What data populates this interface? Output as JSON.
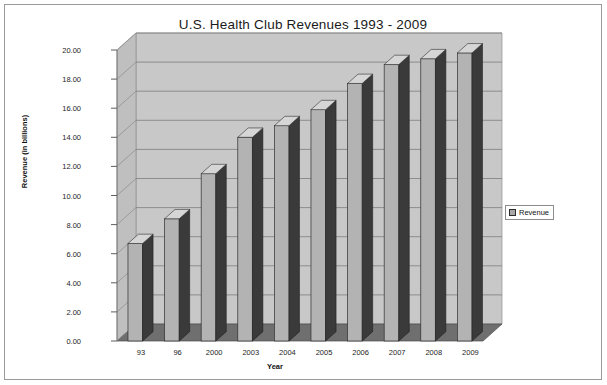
{
  "chart_data": {
    "type": "bar",
    "title": "U.S. Health Club Revenues 1993 - 2009",
    "xlabel": "Year",
    "ylabel": "Revenue (in billions)",
    "categories": [
      "93",
      "96",
      "2000",
      "2003",
      "2004",
      "2005",
      "2006",
      "2007",
      "2008",
      "2009"
    ],
    "values": [
      6.7,
      8.4,
      11.5,
      14.0,
      14.8,
      15.9,
      17.7,
      19.0,
      19.4,
      19.8
    ],
    "series": [
      {
        "name": "Revenue",
        "values": [
          6.7,
          8.4,
          11.5,
          14.0,
          14.8,
          15.9,
          17.7,
          19.0,
          19.4,
          19.8
        ]
      }
    ],
    "ylim": [
      0.0,
      20.0
    ],
    "ytick_step": 2.0,
    "ytick_labels": [
      "0.00",
      "2.00",
      "4.00",
      "6.00",
      "8.00",
      "10.00",
      "12.00",
      "14.00",
      "16.00",
      "18.00",
      "20.00"
    ],
    "grid": true,
    "legend_position": "right",
    "style": "3d-column",
    "colors": {
      "bar_front": "#b3b3b3",
      "bar_side": "#3a3a3a",
      "bar_top": "#d6d6d6",
      "plot_wall": "#c8c8c8",
      "plot_floor": "#6f6f6f",
      "gridline": "#7d7d7d",
      "frame_border": "#9a9a9a",
      "text": "#1a1a1a",
      "background": "#ffffff"
    }
  },
  "legend": {
    "entries": [
      {
        "label": "Revenue"
      }
    ]
  }
}
